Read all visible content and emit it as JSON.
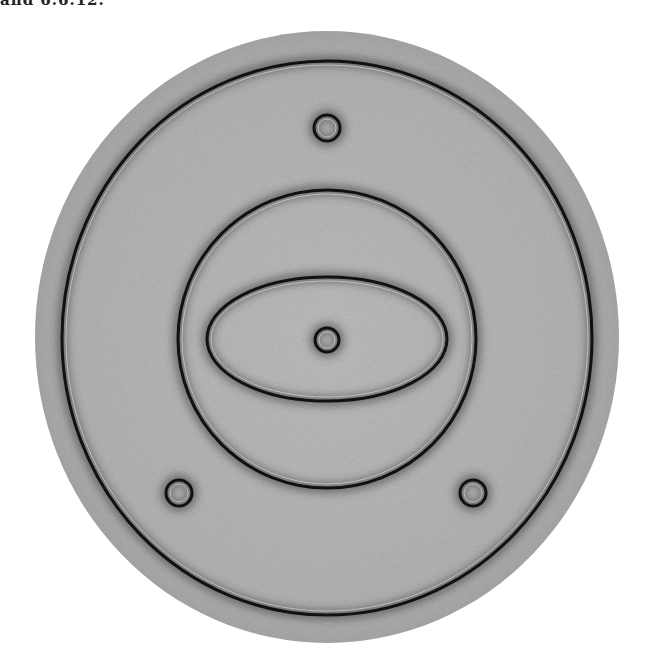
{
  "caption_fragment": "and 6.6.12.",
  "figure": {
    "background_color": "#ffffff",
    "disk_color": "#b4b4b4",
    "line_color": "#111111",
    "disk": {
      "cx": 327,
      "cy": 337,
      "rx": 292,
      "ry": 306
    },
    "outer_ring": {
      "cx": 327,
      "cy": 338,
      "rx": 265,
      "ry": 277
    },
    "inner_circle": {
      "cx": 327,
      "cy": 339,
      "r": 149
    },
    "ellipse": {
      "cx": 327,
      "cy": 339,
      "rx": 120,
      "ry": 62
    },
    "small_rings": [
      {
        "name": "top",
        "cx": 327,
        "cy": 128,
        "r": 13
      },
      {
        "name": "center",
        "cx": 327,
        "cy": 340,
        "r": 12
      },
      {
        "name": "bottom-left",
        "cx": 179,
        "cy": 493,
        "r": 13
      },
      {
        "name": "bottom-right",
        "cx": 473,
        "cy": 493,
        "r": 13
      }
    ]
  }
}
